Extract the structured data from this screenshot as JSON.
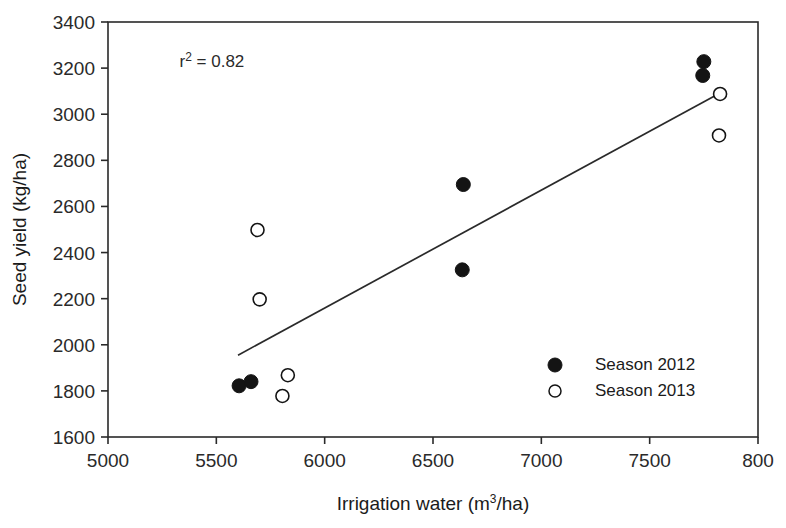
{
  "chart_data": {
    "type": "scatter",
    "title": "",
    "xlabel": "Irrigation water (m3/ha)",
    "xlabel_base": "Irrigation water (m",
    "xlabel_sup": "3",
    "xlabel_tail": "/ha)",
    "ylabel": "Seed yield (kg/ha)",
    "xlim": [
      5000,
      8000
    ],
    "ylim": [
      1600,
      3400
    ],
    "xticks": [
      5000,
      5500,
      6000,
      6500,
      7000,
      7500,
      8000
    ],
    "xtick_labels": [
      "5000",
      "5500",
      "6000",
      "6500",
      "7000",
      "7500",
      "800"
    ],
    "yticks": [
      1600,
      1800,
      2000,
      2200,
      2400,
      2600,
      2800,
      3000,
      3200,
      3400
    ],
    "ytick_labels": [
      "1600",
      "1800",
      "2000",
      "2200",
      "2400",
      "2600",
      "2800",
      "3000",
      "3200",
      "3400"
    ],
    "grid": false,
    "annotations": [
      {
        "text": "r2 = 0.82",
        "text_base": "r",
        "text_sup": "2",
        "text_tail": " = 0.82",
        "x": 5330,
        "y": 3205
      }
    ],
    "series": [
      {
        "name": "Season 2012",
        "marker": "filled-circle",
        "color": "#141414",
        "points": [
          {
            "x": 5605,
            "y": 1822
          },
          {
            "x": 5660,
            "y": 1840
          },
          {
            "x": 6640,
            "y": 2695
          },
          {
            "x": 6635,
            "y": 2325
          },
          {
            "x": 7750,
            "y": 3228
          },
          {
            "x": 7745,
            "y": 3168
          }
        ]
      },
      {
        "name": "Season 2013",
        "marker": "open-circle",
        "color": "#141414",
        "points": [
          {
            "x": 5690,
            "y": 2498
          },
          {
            "x": 5700,
            "y": 2197
          },
          {
            "x": 5830,
            "y": 1868
          },
          {
            "x": 5805,
            "y": 1778
          },
          {
            "x": 7825,
            "y": 3088
          },
          {
            "x": 7820,
            "y": 2908
          }
        ]
      }
    ],
    "trendline": {
      "name": "regression-line",
      "x_start": 5600,
      "y_start": 1955,
      "x_end": 7825,
      "y_end": 3092,
      "color": "#2a2a2a"
    },
    "legend": {
      "position": "inside-lower-right",
      "entries": [
        {
          "label": "Season 2012",
          "marker": "filled-circle"
        },
        {
          "label": "Season 2013",
          "marker": "open-circle"
        }
      ]
    }
  }
}
